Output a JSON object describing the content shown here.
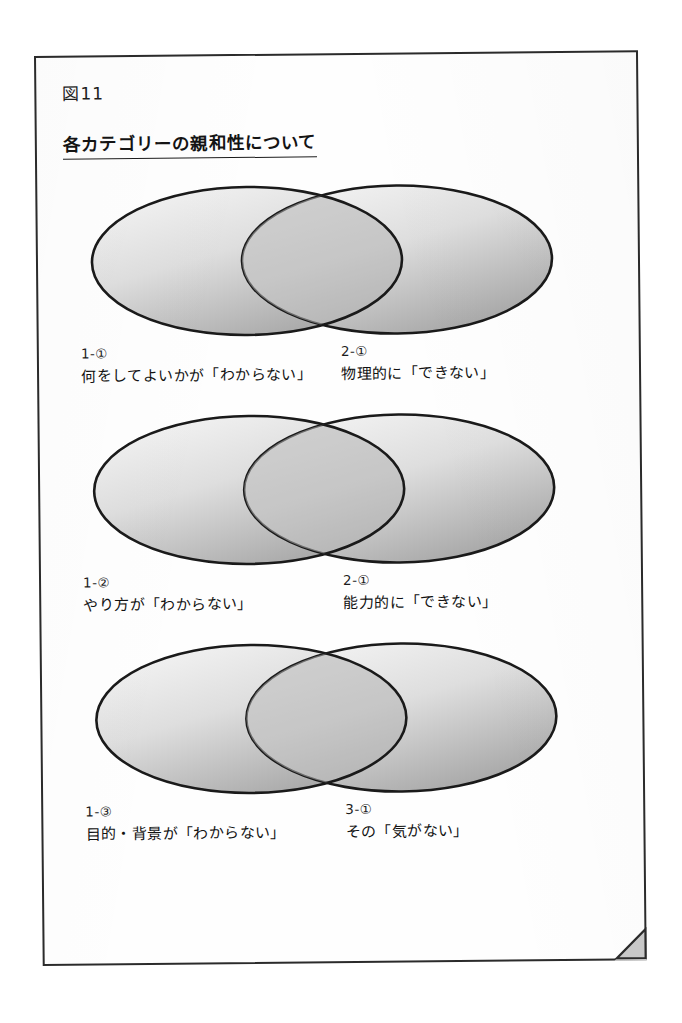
{
  "page": {
    "figure_caption": "図11",
    "title": "各カテゴリーの親和性について",
    "corner_fold_icon": "page-curl-icon"
  },
  "colors": {
    "frame_stroke": "#2b2b2b",
    "ellipse_stroke": "#1a1a1a",
    "ellipse_fill_light": "#f2f2f2",
    "ellipse_fill_dark": "#9a9a9a",
    "overlap_fill": "#a8a8a8",
    "text": "#141414"
  },
  "diagrams": [
    {
      "id": "venn-1",
      "left": {
        "code": "1-①",
        "text": "何をしてよいかが「わからない」"
      },
      "right": {
        "code": "2-①",
        "text": "物理的に「できない」"
      }
    },
    {
      "id": "venn-2",
      "left": {
        "code": "1-②",
        "text": "やり方が「わからない」"
      },
      "right": {
        "code": "2-①",
        "text": "能力的に「できない」"
      }
    },
    {
      "id": "venn-3",
      "left": {
        "code": "1-③",
        "text": "目的・背景が「わからない」"
      },
      "right": {
        "code": "3-①",
        "text": "その「気がない」"
      }
    }
  ]
}
